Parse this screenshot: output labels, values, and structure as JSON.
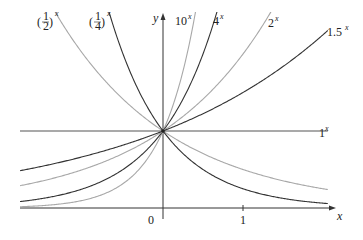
{
  "chart_data": {
    "type": "line",
    "title": "",
    "xlabel": "x",
    "ylabel": "y",
    "xlim": [
      -1.79,
      2.1
    ],
    "ylim": [
      0,
      2.5
    ],
    "grid": false,
    "legend": "inline labels at curve ends",
    "x_ticks": [
      {
        "value": 0,
        "label": "0"
      },
      {
        "value": 1,
        "label": "1"
      }
    ],
    "series": [
      {
        "name": "(1/2)^x",
        "base": 0.5,
        "color": "#a8a8a8",
        "label_base": "1/2",
        "label_pos": "top-left"
      },
      {
        "name": "(1/4)^x",
        "base": 0.25,
        "color": "#333333",
        "label_base": "1/4",
        "label_pos": "top-left"
      },
      {
        "name": "10^x",
        "base": 10,
        "color": "#a8a8a8",
        "label_base": "10",
        "label_pos": "top"
      },
      {
        "name": "4^x",
        "base": 4,
        "color": "#333333",
        "label_base": "4",
        "label_pos": "top"
      },
      {
        "name": "2^x",
        "base": 2,
        "color": "#a8a8a8",
        "label_base": "2",
        "label_pos": "top"
      },
      {
        "name": "1.5^x",
        "base": 1.5,
        "color": "#333333",
        "label_base": "1.5",
        "label_pos": "top-right"
      },
      {
        "name": "1^x",
        "base": 1,
        "color": "#555555",
        "label_base": "1",
        "label_pos": "right"
      }
    ],
    "sample_points": {
      "x": [
        -1.5,
        -1,
        -0.5,
        0,
        0.5,
        1,
        1.5,
        2
      ],
      "(1/2)^x": [
        2.83,
        2,
        1.41,
        1,
        0.71,
        0.5,
        0.35,
        0.25
      ],
      "(1/4)^x": [
        null,
        4,
        2,
        1,
        0.5,
        0.25,
        0.13,
        0.06
      ],
      "10^x": [
        0.03,
        0.1,
        0.32,
        1,
        null,
        null,
        null,
        null
      ],
      "4^x": [
        0.13,
        0.25,
        0.5,
        1,
        2,
        null,
        null,
        null
      ],
      "2^x": [
        0.35,
        0.5,
        0.71,
        1,
        1.41,
        2,
        null,
        null
      ],
      "1.5^x": [
        0.54,
        0.67,
        0.82,
        1,
        1.22,
        1.5,
        1.84,
        2.25
      ],
      "1^x": [
        1,
        1,
        1,
        1,
        1,
        1,
        1,
        1
      ]
    },
    "annotations": [
      "All curves intersect at (0, 1)"
    ]
  },
  "axes": {
    "x_label": "x",
    "y_label": "y",
    "origin_label": "0",
    "tick_1_label": "1"
  },
  "labels": {
    "half": {
      "num": "1",
      "den": "2",
      "exp": "x"
    },
    "quarter": {
      "num": "1",
      "den": "4",
      "exp": "x"
    },
    "ten": {
      "base": "10",
      "exp": "x"
    },
    "four": {
      "base": "4",
      "exp": "x"
    },
    "two": {
      "base": "2",
      "exp": "x"
    },
    "onehalf": {
      "base": "1.5",
      "exp": "x"
    },
    "one": {
      "base": "1",
      "exp": "x"
    }
  }
}
